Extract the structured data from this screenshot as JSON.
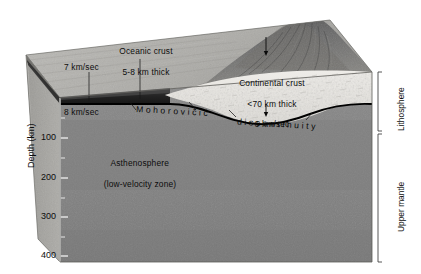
{
  "figure": {
    "background_color": "#ffffff"
  },
  "axis": {
    "title": "Depth (km)",
    "unit": "km",
    "ticks": [
      {
        "label": "100",
        "depth": 100
      },
      {
        "label": "200",
        "depth": 200
      },
      {
        "label": "300",
        "depth": 300
      },
      {
        "label": "400",
        "depth": 400
      }
    ],
    "range": [
      0,
      400
    ]
  },
  "labels": {
    "oceanic_crust": {
      "line1": "Oceanic crust",
      "line2": "5-8 km thick"
    },
    "continental_crust": {
      "line1": "Continental crust",
      "line2": "<70 km thick",
      "line3": "6 km/sec"
    },
    "velocity_upper": "7 km/sec",
    "velocity_lower": "8 km/sec",
    "asthenosphere": {
      "line1": "Asthenosphere",
      "line2": "(low-velocity zone)"
    },
    "moho_name": "Mohorovičić",
    "moho_type": "discontinuity",
    "lithosphere": "Lithosphere",
    "upper_mantle": "Upper mantle"
  },
  "colors": {
    "crust_dark_band": "#2b2b2b",
    "continental_crust_fill": "#e3e1dc",
    "mantle_upper": "#8e8e8e",
    "mantle_lower": "#7e7e7e",
    "top_surface": "#b9b8b4",
    "left_face": "#a9a8a4",
    "moho_line": "#000000",
    "mountain_dark": "#5a5a5a",
    "text": "#0d0d0d"
  }
}
